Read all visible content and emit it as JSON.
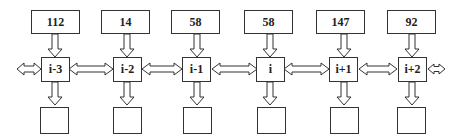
{
  "diagram": {
    "type": "linear-chain",
    "nodes": [
      {
        "label": "i-3",
        "input_value": "112",
        "output_value": ""
      },
      {
        "label": "i-2",
        "input_value": "14",
        "output_value": ""
      },
      {
        "label": "i-1",
        "input_value": "58",
        "output_value": ""
      },
      {
        "label": "i",
        "input_value": "58",
        "output_value": ""
      },
      {
        "label": "i+1",
        "input_value": "147",
        "output_value": ""
      },
      {
        "label": "i+2",
        "input_value": "92",
        "output_value": ""
      }
    ],
    "edges": {
      "vertical_in": "input box → node (down arrow)",
      "vertical_out": "node → output box (down arrow)",
      "horizontal": "bidirectional arrows between adjacent nodes, plus open-ended bidirectional arrows at both ends"
    },
    "colors": {
      "stroke": "#333333",
      "fill": "#ffffff"
    }
  }
}
